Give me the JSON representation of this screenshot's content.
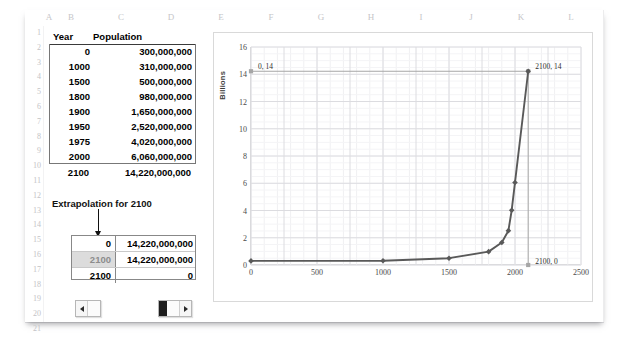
{
  "sheet": {
    "columns": [
      "A",
      "B",
      "C",
      "D",
      "E",
      "F",
      "G",
      "H",
      "I",
      "J",
      "K",
      "L"
    ],
    "rows": [
      "1",
      "2",
      "3",
      "4",
      "5",
      "6",
      "7",
      "8",
      "9",
      "10",
      "11",
      "12",
      "13",
      "14",
      "15",
      "16",
      "17",
      "18",
      "19",
      "20",
      "21"
    ],
    "header": {
      "year": "Year",
      "population": "Population"
    },
    "data_rows": [
      {
        "year": "0",
        "population": "300,000,000"
      },
      {
        "year": "1000",
        "population": "310,000,000"
      },
      {
        "year": "1500",
        "population": "500,000,000"
      },
      {
        "year": "1800",
        "population": "980,000,000"
      },
      {
        "year": "1900",
        "population": "1,650,000,000"
      },
      {
        "year": "1950",
        "population": "2,520,000,000"
      },
      {
        "year": "1975",
        "population": "4,020,000,000"
      },
      {
        "year": "2000",
        "population": "6,060,000,000"
      }
    ],
    "extrapolated_row": {
      "year": "2100",
      "population": "14,220,000,000"
    },
    "extrapolation_label": "Extrapolation for 2100",
    "extrapolation_rows": [
      {
        "year": "0",
        "value": "14,220,000,000",
        "selected": false
      },
      {
        "year": "2100",
        "value": "14,220,000,000",
        "selected": true
      },
      {
        "year": "2100",
        "value": "0",
        "selected": false
      }
    ]
  },
  "controls": {
    "left_scrollbar": {
      "name": "horizontal-scrollbar-small",
      "thumb_position": "left"
    },
    "right_scrollbar": {
      "name": "horizontal-scrollbar-large",
      "thumb_position": "left"
    }
  },
  "chart_data": {
    "type": "line",
    "title": "",
    "xlabel": "",
    "ylabel": "Billions",
    "xlim": [
      0,
      2500
    ],
    "ylim": [
      0,
      16
    ],
    "xticks": [
      "0",
      "500",
      "1000",
      "1500",
      "2000",
      "2500"
    ],
    "yticks": [
      "0",
      "2",
      "4",
      "6",
      "8",
      "10",
      "12",
      "14",
      "16"
    ],
    "grid": true,
    "legend": "none",
    "series": [
      {
        "name": "Population",
        "x": [
          0,
          1000,
          1500,
          1800,
          1900,
          1950,
          1975,
          2000,
          2100
        ],
        "y": [
          0.3,
          0.31,
          0.5,
          0.98,
          1.65,
          2.52,
          4.02,
          6.06,
          14.22
        ],
        "color": "#595959",
        "marker": "diamond"
      },
      {
        "name": "Extrapolation marker line",
        "x": [
          0,
          2100,
          2100
        ],
        "y": [
          14.22,
          14.22,
          0
        ],
        "color": "#a6a6a6",
        "marker": "square"
      }
    ],
    "annotations": [
      {
        "text": "0, 14",
        "x": 0,
        "y": 14.22
      },
      {
        "text": "2100, 14",
        "x": 2100,
        "y": 14.22
      },
      {
        "text": "2100, 0",
        "x": 2100,
        "y": 0
      }
    ]
  }
}
